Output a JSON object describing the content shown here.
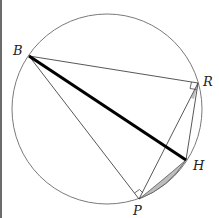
{
  "diagram": {
    "type": "geometry",
    "circle": {
      "cx": 107,
      "cy": 109,
      "r": 95
    },
    "points": {
      "B": {
        "x": 29,
        "y": 56,
        "label": "B",
        "lx": 13,
        "ly": 55
      },
      "R": {
        "x": 198,
        "y": 83,
        "label": "R",
        "lx": 203,
        "ly": 86
      },
      "H": {
        "x": 186,
        "y": 160,
        "label": "H",
        "lx": 193,
        "ly": 170
      },
      "P": {
        "x": 139,
        "y": 199,
        "label": "P",
        "lx": 133,
        "ly": 215
      }
    },
    "segments": [
      {
        "from": "B",
        "to": "R",
        "style": "thin"
      },
      {
        "from": "B",
        "to": "P",
        "style": "thin"
      },
      {
        "from": "B",
        "to": "H",
        "style": "thick"
      },
      {
        "from": "R",
        "to": "P",
        "style": "thin"
      },
      {
        "from": "R",
        "to": "H",
        "style": "thin"
      }
    ],
    "right_angles": [
      "R",
      "P"
    ],
    "shaded_regions": [
      "angle wedge at R between RP and RH",
      "lens between arc PH and chord-curve PH"
    ],
    "colors": {
      "line": "#333333",
      "thick_line": "#000000",
      "circle": "#7a7a7a",
      "shade": "#bdbdbd"
    }
  }
}
